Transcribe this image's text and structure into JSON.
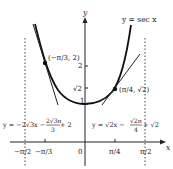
{
  "diagram": {
    "curve_label": "y = sec x",
    "axis_x_label": "x",
    "axis_y_label": "y",
    "point_left_label": "(−π/3, 2)",
    "point_right_label": "(π/4, √2)",
    "y_ticks": {
      "one": "1",
      "sqrt2": "√2",
      "two": "2"
    },
    "x_ticks": {
      "neg_half_pi": "−π/2",
      "neg_third_pi": "−π/3",
      "zero": "0",
      "quarter_pi": "π/4",
      "half_pi": "π/2"
    },
    "tangent_left": {
      "a": "y = −2√3x − ",
      "num": "2√3π",
      "den": "3",
      "b": " + 2"
    },
    "tangent_right": {
      "a": "y = √2x − ",
      "num": "√2π",
      "den": "4",
      "b": " + √2"
    }
  }
}
